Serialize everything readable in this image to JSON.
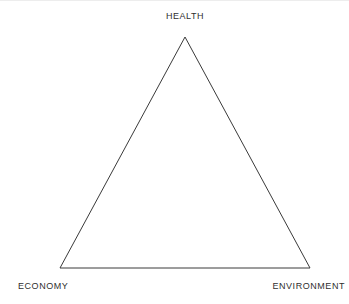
{
  "diagram": {
    "type": "triangle-framework",
    "title": "",
    "background_color": "#ffffff",
    "stroke_color": "#3a3a3a",
    "stroke_width": 1,
    "fill": "none",
    "vertices": [
      {
        "id": "apex",
        "label": "HEALTH",
        "x": 185,
        "y": 37,
        "label_position": "above"
      },
      {
        "id": "bottom-left",
        "label": "ECONOMY",
        "x": 60,
        "y": 268,
        "label_position": "below-left"
      },
      {
        "id": "bottom-right",
        "label": "ENVIRONMENT",
        "x": 310,
        "y": 268,
        "label_position": "below-right"
      }
    ],
    "edges": [
      {
        "from": "bottom-left",
        "to": "apex"
      },
      {
        "from": "apex",
        "to": "bottom-right"
      },
      {
        "from": "bottom-right",
        "to": "bottom-left"
      }
    ],
    "labels": {
      "health": "HEALTH",
      "economy": "ECONOMY",
      "environment": "ENVIRONMENT"
    }
  }
}
